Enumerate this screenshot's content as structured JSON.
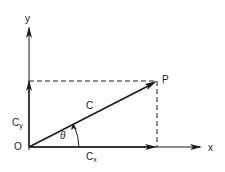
{
  "diagram": {
    "type": "vector-components",
    "colors": {
      "ink": "#1a1a1a",
      "background": "#ffffff"
    },
    "labels": {
      "y_axis": "y",
      "x_axis": "x",
      "origin": "O",
      "point": "P",
      "vector": "C",
      "angle": "θ",
      "cy_main": "C",
      "cy_sub": "y",
      "cx_main": "C",
      "cx_sub": "x"
    }
  }
}
